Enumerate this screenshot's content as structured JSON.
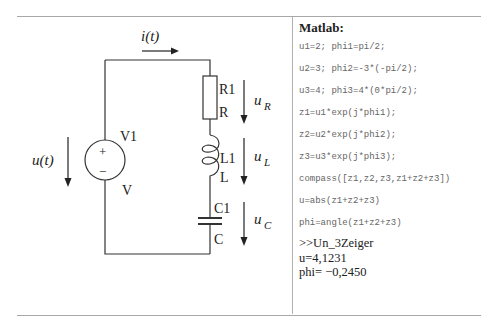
{
  "circuit": {
    "current_label": "i(t)",
    "source_voltage_label": "u(t)",
    "source": {
      "name": "V1",
      "type": "V",
      "plus": "+",
      "minus": "−"
    },
    "resistor": {
      "name": "R1",
      "type": "R",
      "voltage_label_base": "u",
      "voltage_label_sub": "R"
    },
    "inductor": {
      "name": "L1",
      "type": "L",
      "voltage_label_base": "u",
      "voltage_label_sub": "L"
    },
    "capacitor": {
      "name": "C1",
      "type": "C",
      "voltage_label_base": "u",
      "voltage_label_sub": "C"
    }
  },
  "matlab": {
    "title": "Matlab:",
    "code_lines": [
      "u1=2; phi1=pi/2;",
      "u2=3; phi2=-3*(-pi/2);",
      "u3=4; phi3=4*(0*pi/2);",
      "z1=u1*exp(j*phi1);",
      "z2=u2*exp(j*phi2);",
      "z3=u3*exp(j*phi3);",
      "compass([z1,z2,z3,z1+z2+z3])",
      "u=abs(z1+z2+z3)",
      "phi=angle(z1+z2+z3)"
    ],
    "output_lines": [
      ">>Un_3Zeiger",
      "u=4,1231",
      "phi= −0,2450"
    ]
  }
}
